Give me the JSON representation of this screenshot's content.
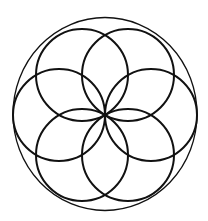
{
  "diagram": {
    "title": "",
    "type": "seed-of-life",
    "stroke_color": "#111111",
    "background": "#ffffff",
    "outer_circle": {
      "cx": 105,
      "cy": 114,
      "rx": 92,
      "ry": 96.5,
      "stroke_width": 1.3
    },
    "petal_circles": [
      {
        "cx": 59,
        "cy": 115,
        "r": 46
      },
      {
        "cx": 82,
        "cy": 75,
        "r": 46
      },
      {
        "cx": 128,
        "cy": 75,
        "r": 46
      },
      {
        "cx": 151,
        "cy": 115,
        "r": 46
      },
      {
        "cx": 128,
        "cy": 155,
        "r": 46
      },
      {
        "cx": 82,
        "cy": 155,
        "r": 46
      }
    ],
    "petal_stroke_width": 2
  }
}
